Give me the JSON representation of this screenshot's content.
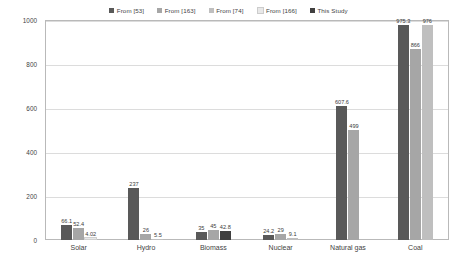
{
  "chart_data": {
    "type": "bar",
    "title": "",
    "xlabel": "",
    "ylabel": "GHG emission (g-CO₂-eq./kWh)",
    "ylim": [
      0,
      1000
    ],
    "yticks": [
      0,
      200,
      400,
      600,
      800,
      1000
    ],
    "grid": true,
    "legend_position": "top-center",
    "categories": [
      "Solar",
      "Hydro",
      "Biomass",
      "Nuclear",
      "Natural gas",
      "Coal"
    ],
    "series": [
      {
        "name": "From [53]",
        "color": "#595959",
        "values": [
          66.1,
          237,
          35,
          24.2,
          607.6,
          975.3
        ],
        "labels": [
          "66.1",
          "237",
          "35",
          "24.2",
          "607.6",
          "975.3"
        ]
      },
      {
        "name": "From [163]",
        "color": "#a6a6a6",
        "values": [
          52.4,
          26,
          45,
          29,
          499,
          866
        ],
        "labels": [
          "52.4",
          "26",
          "45",
          "29",
          "499",
          "866"
        ]
      },
      {
        "name": "From [74]",
        "color": "#bfbfbf",
        "values": [
          null,
          5.5,
          null,
          9.1,
          null,
          976
        ],
        "labels": [
          "",
          "5.5",
          "",
          "9.1",
          "",
          "976"
        ]
      },
      {
        "name": "From [166]",
        "color": "#e8e8e8",
        "values": [
          4.02,
          null,
          null,
          null,
          null,
          null
        ],
        "labels": [
          "4.02",
          "",
          "",
          "",
          "",
          ""
        ]
      },
      {
        "name": "This Study",
        "color": "#404040",
        "values": [
          null,
          null,
          42.8,
          null,
          null,
          null
        ],
        "labels": [
          "",
          "",
          "42.8",
          "",
          "",
          ""
        ]
      }
    ]
  },
  "legend": {
    "items": [
      {
        "label": "From [53]",
        "color": "#595959"
      },
      {
        "label": "From [163]",
        "color": "#a6a6a6"
      },
      {
        "label": "From [74]",
        "color": "#bfbfbf"
      },
      {
        "label": "From [166]",
        "color": "#e8e8e8"
      },
      {
        "label": "This Study",
        "color": "#404040"
      }
    ]
  },
  "yaxis": {
    "title": "GHG emission (g-CO₂-eq./kWh)",
    "ticks": [
      "1000",
      "800",
      "600",
      "400",
      "200",
      "0"
    ]
  }
}
